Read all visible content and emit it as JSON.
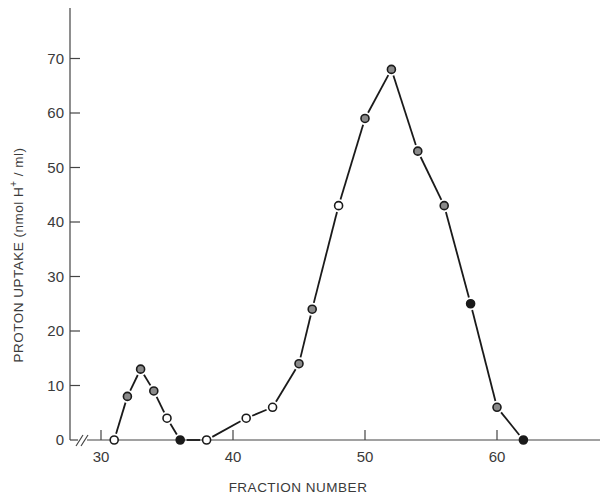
{
  "chart_data": {
    "type": "line",
    "title": "",
    "xlabel": "FRACTION NUMBER",
    "ylabel": "PROTON UPTAKE (nmol H⁺ / ml)",
    "ylabel_parts": {
      "main": "PROTON UPTAKE  (nmol H",
      "sup": "+",
      "tail": " / ml)"
    },
    "xlim": [
      30,
      67
    ],
    "ylim": [
      0,
      75
    ],
    "x_axis_break": true,
    "xticks": [
      30,
      40,
      50,
      60
    ],
    "yticks": [
      0,
      10,
      20,
      30,
      40,
      50,
      60,
      70
    ],
    "grid": false,
    "legend": null,
    "series": [
      {
        "name": "proton uptake",
        "color": "#1a1a1a",
        "marker": "circle",
        "x": [
          31,
          32,
          33,
          34,
          35,
          36,
          38,
          41,
          43,
          45,
          46,
          48,
          50,
          52,
          54,
          56,
          58,
          60,
          62
        ],
        "y": [
          0,
          8,
          13,
          9,
          4,
          0,
          0,
          4,
          6,
          14,
          24,
          43,
          59,
          68,
          53,
          43,
          25,
          6,
          0
        ],
        "marker_fill": [
          "open",
          "half",
          "half",
          "half",
          "open",
          "filled",
          "open",
          "open",
          "open",
          "half",
          "half",
          "open",
          "half",
          "half",
          "half",
          "half",
          "filled",
          "half",
          "filled"
        ]
      }
    ]
  },
  "plot_area": {
    "origin_px": [
      70,
      440
    ],
    "x_px_for_30": 101,
    "x_px_per_unit": 13.2,
    "y_px_per_unit": 5.45,
    "y_axis_top_px": 8,
    "x_axis_right_px": 600
  }
}
